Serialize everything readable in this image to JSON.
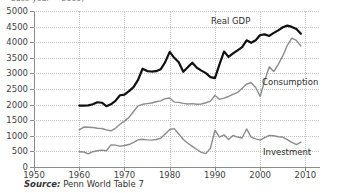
{
  "figure": {
    "top_caption": "base year = 2005)",
    "source_prefix": "Source:",
    "source_text": "Penn World Table 7"
  },
  "labels": {
    "real_gdp": "Real GDP",
    "consumption": "Consumption",
    "investment": "Investment"
  },
  "colors": {
    "real_gdp": "#111111",
    "consumption": "#8c8c8c",
    "investment": "#8c8c8c",
    "grid": "#c3c3c3",
    "axis": "#8b8b8b",
    "text": "#3f3f3f"
  },
  "chart_data": {
    "type": "line",
    "title": "",
    "xlabel": "",
    "ylabel": "",
    "xlim": [
      1950,
      2013
    ],
    "ylim": [
      0,
      5000
    ],
    "xticks": [
      1950,
      1960,
      1970,
      1980,
      1990,
      2000,
      2010
    ],
    "yticks": [
      0,
      500,
      1000,
      1500,
      2000,
      2500,
      3000,
      3500,
      4000,
      4500,
      5000
    ],
    "grid": true,
    "legend": "inline-annotations",
    "x": [
      1960,
      1961,
      1962,
      1963,
      1964,
      1965,
      1966,
      1967,
      1968,
      1969,
      1970,
      1971,
      1972,
      1973,
      1974,
      1975,
      1976,
      1977,
      1978,
      1979,
      1980,
      1981,
      1982,
      1983,
      1984,
      1985,
      1986,
      1987,
      1988,
      1989,
      1990,
      1991,
      1992,
      1993,
      1994,
      1995,
      1996,
      1997,
      1998,
      1999,
      2000,
      2001,
      2002,
      2003,
      2004,
      2005,
      2006,
      2007,
      2008,
      2009
    ],
    "series": [
      {
        "name": "Real GDP",
        "color": "#111111",
        "width": 2.2,
        "values": [
          1970,
          1965,
          1975,
          2010,
          2075,
          2060,
          1950,
          2010,
          2120,
          2300,
          2320,
          2430,
          2560,
          2790,
          3150,
          3075,
          3060,
          3070,
          3130,
          3360,
          3690,
          3500,
          3360,
          3050,
          3200,
          3340,
          3180,
          3090,
          3010,
          2880,
          2850,
          3290,
          3700,
          3530,
          3640,
          3740,
          3840,
          4060,
          3980,
          4060,
          4230,
          4250,
          4200,
          4300,
          4380,
          4480,
          4530,
          4490,
          4420,
          4270
        ]
      },
      {
        "name": "Consumption",
        "color": "#8c8c8c",
        "width": 1.4,
        "values": [
          1190,
          1280,
          1275,
          1265,
          1240,
          1235,
          1190,
          1160,
          1240,
          1370,
          1470,
          1590,
          1780,
          1960,
          2010,
          2030,
          2050,
          2090,
          2120,
          2190,
          2210,
          2080,
          2070,
          2040,
          2020,
          2030,
          2010,
          2020,
          2060,
          2110,
          2290,
          2170,
          2210,
          2260,
          2330,
          2390,
          2520,
          2660,
          2700,
          2550,
          2260,
          2780,
          3210,
          3060,
          3290,
          3560,
          3900,
          4130,
          4060,
          3880
        ]
      },
      {
        "name": "Investment",
        "color": "#8c8c8c",
        "width": 1.4,
        "values": [
          490,
          480,
          420,
          490,
          520,
          540,
          520,
          710,
          700,
          670,
          690,
          720,
          790,
          870,
          890,
          870,
          860,
          880,
          920,
          1060,
          1200,
          1230,
          1060,
          880,
          760,
          660,
          560,
          470,
          430,
          600,
          1180,
          960,
          1030,
          880,
          1010,
          960,
          930,
          1220,
          960,
          900,
          860,
          940,
          1010,
          1000,
          970,
          960,
          880,
          790,
          720,
          800
        ]
      }
    ]
  }
}
